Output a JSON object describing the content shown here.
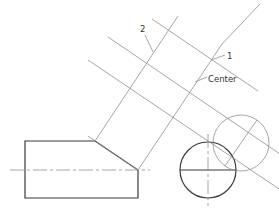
{
  "diagram": {
    "type": "auxiliary-view-drawing",
    "labels": {
      "ref2": "2",
      "ref1": "1",
      "center": "Center"
    },
    "colors": {
      "object_line": "#3a3a3a",
      "construction_line": "#8f8f8f",
      "background": "#ffffff"
    }
  }
}
